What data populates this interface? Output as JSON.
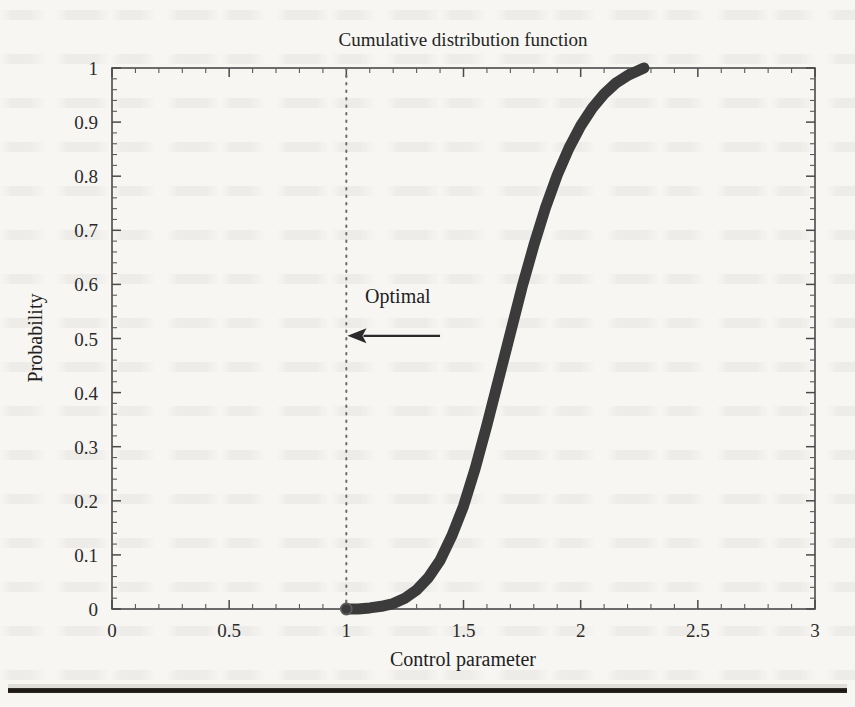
{
  "figure": {
    "title": "Cumulative distribution function",
    "optimal_annotation": "Optimal"
  },
  "chart_data": {
    "type": "line",
    "title": "Cumulative distribution function",
    "xlabel": "Control parameter",
    "ylabel": "Probability",
    "xlim": [
      0,
      3
    ],
    "ylim": [
      0,
      1
    ],
    "xticks": [
      "0",
      "0.5",
      "1",
      "1.5",
      "2",
      "2.5",
      "3"
    ],
    "xtick_values": [
      0,
      0.5,
      1,
      1.5,
      2,
      2.5,
      3
    ],
    "x_minor_step": 0.1,
    "yticks": [
      "0",
      "0.1",
      "0.2",
      "0.3",
      "0.4",
      "0.5",
      "0.6",
      "0.7",
      "0.8",
      "0.9",
      "1"
    ],
    "ytick_values": [
      0,
      0.1,
      0.2,
      0.3,
      0.4,
      0.5,
      0.6,
      0.7,
      0.8,
      0.9,
      1
    ],
    "grid": false,
    "legend": false,
    "line_color": "#3b3b3b",
    "line_width": 11,
    "series": [
      {
        "name": "CDF",
        "x": [
          1.0,
          1.05,
          1.1,
          1.15,
          1.2,
          1.25,
          1.3,
          1.35,
          1.4,
          1.45,
          1.5,
          1.55,
          1.6,
          1.65,
          1.7,
          1.75,
          1.8,
          1.85,
          1.9,
          1.95,
          2.0,
          2.05,
          2.1,
          2.15,
          2.2,
          2.27
        ],
        "y": [
          0.0,
          0.0,
          0.002,
          0.005,
          0.01,
          0.02,
          0.035,
          0.058,
          0.09,
          0.135,
          0.19,
          0.26,
          0.34,
          0.425,
          0.51,
          0.595,
          0.672,
          0.742,
          0.802,
          0.852,
          0.893,
          0.926,
          0.952,
          0.972,
          0.986,
          1.0
        ]
      }
    ],
    "start_marker": {
      "x": 1,
      "y": 0,
      "style": "open-circle"
    },
    "annotations": [
      {
        "text": "Optimal",
        "text_x": 1.08,
        "text_y": 0.565,
        "arrow": {
          "from_x": 1.4,
          "from_y": 0.505,
          "to_x": 1.005,
          "to_y": 0.505,
          "direction": "left"
        }
      },
      {
        "type": "vertical-line",
        "x": 1.0,
        "style": "dotted",
        "color": "#6b6b6b"
      }
    ]
  }
}
